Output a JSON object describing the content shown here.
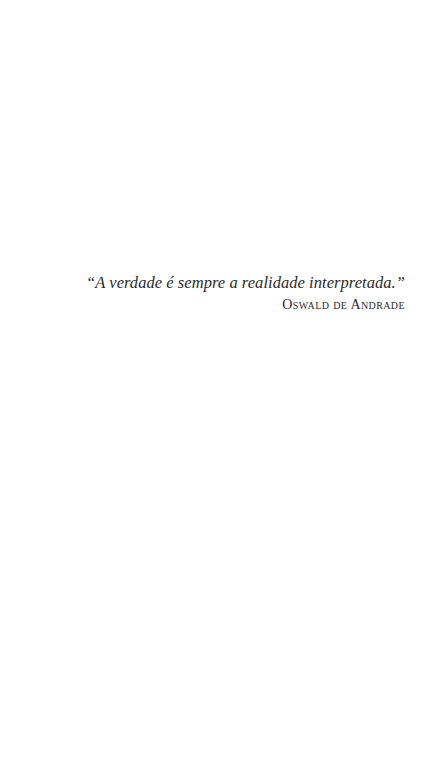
{
  "epigraph": {
    "quote": "“A verdade é sempre a realidade interpretada.”",
    "author": "Oswald de Andrade"
  },
  "colors": {
    "background": "#ffffff",
    "text": "#2b2b2b"
  }
}
